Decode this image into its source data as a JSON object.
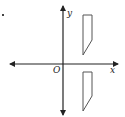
{
  "figure": {
    "axes": {
      "x_label": "x",
      "y_label": "y",
      "origin_label": "O"
    },
    "shapes": [
      {
        "name": "upper-quadrilateral",
        "quadrant": "I"
      },
      {
        "name": "lower-quadrilateral",
        "quadrant": "IV"
      }
    ],
    "colors": {
      "stroke": "#222222",
      "shape_stroke": "#555555",
      "background": "#ffffff"
    }
  }
}
